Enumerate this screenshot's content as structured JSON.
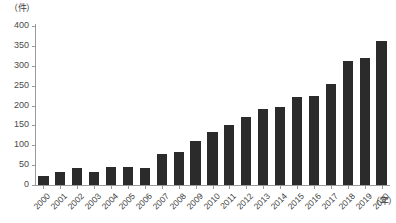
{
  "chart_data": {
    "type": "bar",
    "title": "",
    "xlabel": "（年）",
    "ylabel": "（件）",
    "ylim": [
      0,
      400
    ],
    "ytick_step": 50,
    "yticks": [
      0,
      50,
      100,
      150,
      200,
      250,
      300,
      350,
      400
    ],
    "ytick_labels": [
      "0",
      "50",
      "100",
      "150",
      "200",
      "250",
      "300",
      "350",
      "400"
    ],
    "grid": false,
    "legend": null,
    "bar_color": "#2b2b2b",
    "axis_color": "#9a9a9a",
    "categories": [
      "2000",
      "2001",
      "2002",
      "2003",
      "2004",
      "2005",
      "2006",
      "2007",
      "2008",
      "2009",
      "2010",
      "2011",
      "2012",
      "2013",
      "2014",
      "2015",
      "2016",
      "2017",
      "2018",
      "2019",
      "2020"
    ],
    "values": [
      23,
      32,
      42,
      34,
      45,
      45,
      42,
      78,
      83,
      110,
      133,
      151,
      170,
      190,
      197,
      221,
      224,
      255,
      313,
      320,
      362
    ]
  }
}
